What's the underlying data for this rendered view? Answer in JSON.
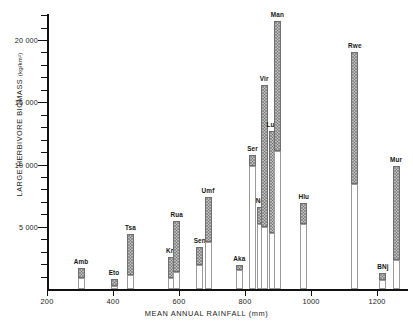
{
  "figure": {
    "axis_title_y": "LARGE HERBIVORE BIOMASS",
    "axis_title_y_unit": "(kg/km²)",
    "axis_title_x": "MEAN ANNUAL RAINFALL (mm)"
  },
  "chart_data": {
    "type": "bar",
    "title": "",
    "xlabel": "MEAN ANNUAL RAINFALL (mm)",
    "ylabel": "LARGE HERBIVORE BIOMASS (kg/km²)",
    "xlim": [
      160,
      1290
    ],
    "ylim": [
      0,
      22500
    ],
    "xticks": [
      200,
      400,
      600,
      800,
      1000,
      1200
    ],
    "xtick_labels": [
      "200",
      "400",
      "600",
      "800",
      "1000",
      "1200"
    ],
    "yticks": [
      5000,
      10000,
      15000,
      20000
    ],
    "ytick_labels": [
      "5 000",
      "10 000",
      "15 000",
      "20 000"
    ],
    "yticks_minor": [
      1000,
      2000,
      3000,
      4000,
      6000,
      7000,
      8000,
      9000,
      11000,
      12000,
      13000,
      14000,
      16000,
      17000,
      18000,
      19000,
      21000,
      22000
    ],
    "grid": false,
    "legend": false,
    "bar_style": "range bar: open white lower segment, stippled upper segment",
    "categories": [
      "Amb",
      "Eto",
      "Tsa",
      "Kru",
      "Rua",
      "Sen",
      "Umf",
      "Aka",
      "Ser",
      "Nai",
      "Vir",
      "Lua",
      "Man",
      "Hlu",
      "Rwe",
      "BNj",
      "Mur"
    ],
    "points": [
      {
        "label": "Amb",
        "rainfall": 300,
        "lower": 0,
        "range_low": 900,
        "range_high": 1700
      },
      {
        "label": "Eto",
        "rainfall": 400,
        "lower": 0,
        "range_low": 250,
        "range_high": 800
      },
      {
        "label": "Tsa",
        "rainfall": 450,
        "lower": 0,
        "range_low": 1100,
        "range_high": 4450
      },
      {
        "label": "Kru",
        "rainfall": 575,
        "lower": 0,
        "range_low": 900,
        "range_high": 2600
      },
      {
        "label": "Rua",
        "rainfall": 590,
        "lower": 0,
        "range_low": 1400,
        "range_high": 5500
      },
      {
        "label": "Sen",
        "rainfall": 660,
        "lower": 0,
        "range_low": 1900,
        "range_high": 3400
      },
      {
        "label": "Umf",
        "rainfall": 685,
        "lower": 0,
        "range_low": 3800,
        "range_high": 7400
      },
      {
        "label": "Aka",
        "rainfall": 780,
        "lower": 0,
        "range_low": 1500,
        "range_high": 1900
      },
      {
        "label": "Ser",
        "rainfall": 820,
        "lower": 0,
        "range_low": 9900,
        "range_high": 10800
      },
      {
        "label": "Nai",
        "rainfall": 845,
        "lower": 0,
        "range_low": 5200,
        "range_high": 6600
      },
      {
        "label": "Vir",
        "rainfall": 855,
        "lower": 0,
        "range_low": 5000,
        "range_high": 16400
      },
      {
        "label": "Lua",
        "rainfall": 880,
        "lower": 0,
        "range_low": 4500,
        "range_high": 12700
      },
      {
        "label": "Man",
        "rainfall": 895,
        "lower": 0,
        "range_low": 11100,
        "range_high": 21500
      },
      {
        "label": "Hlu",
        "rainfall": 975,
        "lower": 0,
        "range_low": 5200,
        "range_high": 6900
      },
      {
        "label": "Rwe",
        "rainfall": 1130,
        "lower": 0,
        "range_low": 8400,
        "range_high": 19000
      },
      {
        "label": "BNj",
        "rainfall": 1215,
        "lower": 0,
        "range_low": 700,
        "range_high": 1250
      },
      {
        "label": "Mur",
        "rainfall": 1255,
        "lower": 0,
        "range_low": 2300,
        "range_high": 9900
      }
    ]
  }
}
